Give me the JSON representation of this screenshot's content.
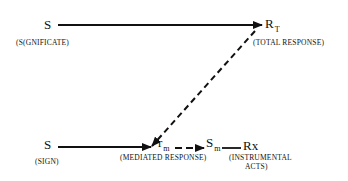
{
  "diagram": {
    "top_row": {
      "stimulus": {
        "symbol": "S",
        "caption": "(S(GNIFICATE)"
      },
      "response": {
        "symbol": "R",
        "subscript": "T",
        "caption": "(TOTAL RESPONSE)"
      }
    },
    "bottom_row": {
      "stimulus": {
        "symbol": "S",
        "caption": "(SIGN)"
      },
      "mediated_response": {
        "symbol": "r",
        "subscript": "m",
        "caption": "(MEDIATED RESPONSE)"
      },
      "mediated_stimulus": {
        "symbol": "S",
        "subscript": "m"
      },
      "instrumental": {
        "symbol": "Rx",
        "caption_line1": "(INSTRUMENTAL",
        "caption_line2": "ACTS)"
      }
    },
    "colors": {
      "ink": "#111111",
      "background": "#ffffff"
    }
  }
}
